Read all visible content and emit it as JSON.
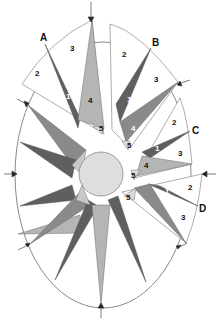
{
  "diagram": {
    "type": "exploded compass rose",
    "colors": {
      "dark": "#5f5f5f",
      "mid": "#8a8a8a",
      "light": "#b5b5b5",
      "center": "#dedede",
      "outline": "#7a7a7a",
      "background": "#ffffff"
    },
    "segment_labels": [
      "A",
      "B",
      "C",
      "D"
    ],
    "piece_numbers": [
      "1",
      "2",
      "3",
      "4",
      "5"
    ],
    "segments": [
      {
        "label": "A",
        "pieces": [
          "1",
          "2",
          "3",
          "4",
          "5"
        ]
      },
      {
        "label": "B",
        "pieces": [
          "1",
          "2",
          "3",
          "4",
          "5"
        ]
      },
      {
        "label": "C",
        "pieces": [
          "1",
          "2",
          "3",
          "4",
          "5"
        ]
      },
      {
        "label": "D",
        "pieces": [
          "1",
          "2",
          "3",
          "4",
          "5"
        ]
      }
    ]
  }
}
